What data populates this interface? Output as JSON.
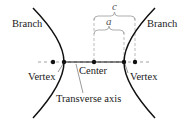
{
  "diagram": {
    "type": "hyperbola",
    "labels": {
      "branch_left": "Branch",
      "branch_right": "Branch",
      "vertex_left": "Vertex",
      "vertex_right": "Vertex",
      "center": "Center",
      "transverse_axis": "Transverse axis",
      "c": "c",
      "a": "a"
    },
    "colors": {
      "curve": "#111111",
      "dashed": "#999999",
      "text": "#1a1a1a"
    }
  }
}
